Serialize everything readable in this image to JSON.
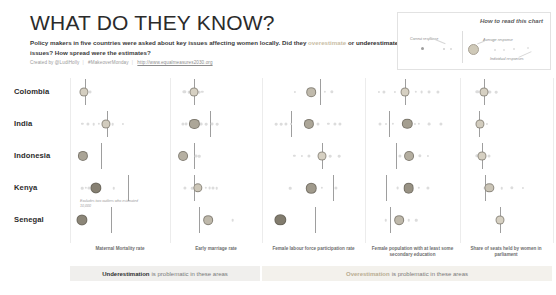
{
  "header": {
    "title": "WHAT DO THEY KNOW?",
    "subtitle_a": "Policy makers in five countries were asked about key issues affecting women locally. Did they ",
    "subtitle_over": "overestimate",
    "subtitle_b": " or ",
    "subtitle_under": "underestimate",
    "subtitle_c": " issues? How spread were the estimates?",
    "credit_author": "Created by @LudiHolly",
    "credit_hashtag": "#MakeoverMonday",
    "credit_link": "http://www.equalmeasures2030.org"
  },
  "legend": {
    "title": "How to read this chart",
    "correct_label": "Correct response",
    "average_label": "Average response",
    "individual_label": "Individual responses"
  },
  "banners": {
    "under_strong": "Underestimation",
    "under_rest": "is problematic in these areas",
    "over_strong": "Overestimation",
    "over_rest": "is problematic in these areas"
  },
  "annotation": {
    "kenya_note": "Excludes two outliers who estimated 10,000"
  },
  "colors": {
    "average_fill": "#cfc9b8",
    "individual_fill": "#dcdcdc",
    "reference_line": "#9e9e9e",
    "overestimate_text": "#c9bda4",
    "underestimate_text": "#2b2b2b",
    "banner_under_bg": "#f0efed",
    "banner_over_bg": "#f3f1ec"
  },
  "chart_data": {
    "type": "scatter",
    "title": "WHAT DO THEY KNOW?",
    "subtitle": "Policy makers in five countries were asked about key issues affecting women locally. Did they overestimate or underestimate issues? How spread were the estimates?",
    "xlabel": "",
    "ylabel": "",
    "grid": false,
    "legend_position": "top-right",
    "rows": [
      "Colombia",
      "India",
      "Indonesia",
      "Kenya",
      "Senegal"
    ],
    "columns": [
      "Maternal Mortality rate",
      "Early marriage rate",
      "Female labour force participation rate",
      "Female population with at least some secondary education",
      "Share of seats held by women in parliament"
    ],
    "column_groups": [
      {
        "label": "Underestimation is problematic in these areas",
        "columns": [
          "Maternal Mortality rate",
          "Early marriage rate"
        ]
      },
      {
        "label": "Overestimation is problematic in these areas",
        "columns": [
          "Female labour force participation rate",
          "Female population with at least some secondary education",
          "Share of seats held by women in parliament"
        ]
      }
    ],
    "series": [
      {
        "column": "Maternal Mortality rate",
        "cells": [
          {
            "row": "Colombia",
            "correct": 6,
            "average": 5,
            "individual": [
              5,
              9,
              13
            ]
          },
          {
            "row": "India",
            "correct": 34,
            "average": 32,
            "individual": [
              3,
              10,
              17,
              24,
              41,
              54
            ]
          },
          {
            "row": "Indonesia",
            "correct": 26,
            "average": 4,
            "individual": [
              4,
              9
            ]
          },
          {
            "row": "Kenya",
            "correct": 60,
            "average": 20,
            "individual": [
              3,
              7,
              11,
              20,
              42
            ]
          },
          {
            "row": "Senegal",
            "correct": 39,
            "average": 2,
            "individual": [
              2
            ]
          }
        ]
      },
      {
        "column": "Early marriage rate",
        "cells": [
          {
            "row": "Colombia",
            "correct": 20,
            "average": 20,
            "individual": [
              6,
              12,
              27,
              31
            ]
          },
          {
            "row": "India",
            "correct": 41,
            "average": 20,
            "individual": [
              4,
              9,
              14,
              29,
              36,
              44,
              52
            ]
          },
          {
            "row": "Indonesia",
            "correct": 20,
            "average": 4,
            "individual": [
              4,
              22,
              27
            ]
          },
          {
            "row": "Kenya",
            "correct": 20,
            "average": 25,
            "individual": [
              7,
              17,
              22,
              36,
              41,
              46,
              51
            ]
          },
          {
            "row": "Senegal",
            "correct": 27,
            "average": 39,
            "individual": [
              39,
              73
            ]
          }
        ]
      },
      {
        "column": "Female labour force participation rate",
        "cells": [
          {
            "row": "Colombia",
            "correct": 58,
            "average": 47,
            "individual": [
              28,
              47,
              64,
              72
            ]
          },
          {
            "row": "India",
            "correct": 23,
            "average": 44,
            "individual": [
              5,
              11,
              17,
              23,
              44,
              55,
              68,
              76,
              82
            ]
          },
          {
            "row": "Indonesia",
            "correct": 60,
            "average": 60,
            "individual": [
              27,
              36,
              44,
              60,
              70,
              81
            ]
          },
          {
            "row": "Kenya",
            "correct": 74,
            "average": 47,
            "individual": [
              22,
              47,
              60,
              77
            ]
          },
          {
            "row": "Senegal",
            "correct": 52,
            "average": 10,
            "individual": [
              10
            ]
          }
        ]
      },
      {
        "column": "Female population with at least some secondary education",
        "cells": [
          {
            "row": "Colombia",
            "correct": 40,
            "average": 40,
            "individual": [
              5,
              12,
              27,
              40,
              54,
              62,
              72,
              84
            ]
          },
          {
            "row": "India",
            "correct": 18,
            "average": 43,
            "individual": [
              7,
              15,
              24,
              43,
              53,
              58,
              72,
              88
            ]
          },
          {
            "row": "Indonesia",
            "correct": 28,
            "average": 45,
            "individual": [
              33,
              45,
              60,
              70
            ]
          },
          {
            "row": "Kenya",
            "correct": 14,
            "average": 45,
            "individual": [
              30,
              45,
              58,
              70
            ]
          },
          {
            "row": "Senegal",
            "correct": 20,
            "average": 32,
            "individual": [
              14,
              32,
              45,
              55
            ]
          }
        ]
      },
      {
        "column": "Share of seats held by women in parliament",
        "cells": [
          {
            "row": "Colombia",
            "correct": 19,
            "average": 19,
            "individual": [
              10,
              19,
              27,
              36
            ]
          },
          {
            "row": "India",
            "correct": 12,
            "average": 14,
            "individual": [
              14,
              24
            ]
          },
          {
            "row": "Indonesia",
            "correct": 17,
            "average": 17,
            "individual": [
              10,
              17,
              26
            ]
          },
          {
            "row": "Kenya",
            "correct": 21,
            "average": 27,
            "individual": [
              21,
              27,
              44,
              58,
              74
            ]
          },
          {
            "row": "Senegal",
            "correct": 42,
            "average": 42,
            "individual": [
              42
            ]
          }
        ]
      }
    ]
  }
}
